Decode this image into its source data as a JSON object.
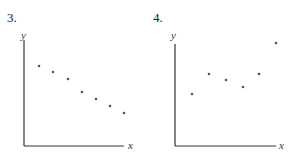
{
  "chart_data": [
    {
      "type": "scatter",
      "title": "3.",
      "xlabel": "x",
      "ylabel": "y",
      "grid": false,
      "ticks": false,
      "description": "Decreasing roughly linear trend",
      "points_px": [
        [
          39,
          66
        ],
        [
          53,
          72
        ],
        [
          68,
          79
        ],
        [
          82,
          92
        ],
        [
          96,
          99
        ],
        [
          110,
          106
        ],
        [
          124,
          113
        ]
      ],
      "x": [
        1,
        2,
        3,
        4,
        5,
        6,
        7
      ],
      "y": [
        7.5,
        7.0,
        6.4,
        5.2,
        4.5,
        3.9,
        3.3
      ],
      "axes_px": {
        "origin": [
          24,
          146
        ],
        "x_end": 124,
        "y_top": 40
      },
      "labels_px": {
        "title": [
          7,
          11
        ],
        "y": [
          21,
          31
        ],
        "x": [
          128,
          140
        ]
      }
    },
    {
      "type": "scatter",
      "title": "4.",
      "xlabel": "x",
      "ylabel": "y",
      "grid": false,
      "ticks": false,
      "description": "Nonlinear pattern: rises, dips, then rises sharply",
      "points_px": [
        [
          192,
          94
        ],
        [
          209,
          74
        ],
        [
          226,
          80
        ],
        [
          243,
          87
        ],
        [
          259,
          74
        ],
        [
          276,
          43
        ]
      ],
      "x": [
        1,
        2,
        3,
        4,
        5,
        6
      ],
      "y": [
        5.0,
        6.8,
        6.3,
        5.6,
        6.8,
        9.6
      ],
      "axes_px": {
        "origin": [
          175,
          146
        ],
        "x_end": 276,
        "y_top": 44
      },
      "labels_px": {
        "title": [
          153,
          11
        ],
        "y": [
          171,
          31
        ],
        "x": [
          279,
          140
        ]
      }
    }
  ],
  "charts": [
    {
      "title": "3.",
      "xlabel": "x",
      "ylabel": "y"
    },
    {
      "title": "4.",
      "xlabel": "x",
      "ylabel": "y"
    }
  ],
  "colors": {
    "axis": "#333333",
    "point": "#555555"
  }
}
